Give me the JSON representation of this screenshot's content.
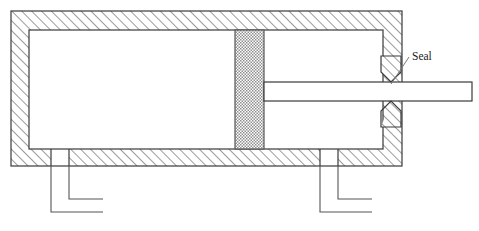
{
  "figure": {
    "kind": "engineering-cross-section",
    "title": "",
    "background_color": "#ffffff",
    "line_color": "#3a3a3a",
    "hatch_color": "#3a3a3a",
    "stipple_color": "#808080"
  },
  "labels": {
    "seal": "Seal"
  },
  "components": {
    "housing": {
      "name": "cylinder-housing",
      "wall_style": "diagonal-hatch",
      "outer": {
        "x": 11,
        "y": 11,
        "width": 391,
        "height": 155
      },
      "top_wall_thickness": 19,
      "left_wall_thickness": 18,
      "right_wall_thickness": 19,
      "bottom_wall_thickness": 17
    },
    "piston": {
      "name": "piston-block",
      "fill_style": "stipple",
      "x": 235,
      "y": 30,
      "width": 29,
      "height": 119
    },
    "rod": {
      "name": "piston-rod",
      "x": 264,
      "y": 82,
      "width": 208,
      "height": 19
    },
    "seal_upper": {
      "name": "upper-seal-wedge",
      "tip_x": 391,
      "tip_y": 82,
      "width": 20,
      "height": 26
    },
    "seal_lower": {
      "name": "lower-seal-wedge",
      "tip_x": 391,
      "tip_y": 101,
      "width": 20,
      "height": 26
    },
    "port_left": {
      "name": "left-port-pipe",
      "inner_x": 68,
      "outer_x": 51,
      "top_y": 166,
      "inner_bend_y": 199,
      "outer_bend_y": 212,
      "inner_end_x": 103,
      "outer_end_x": 103
    },
    "port_right": {
      "name": "right-port-pipe",
      "inner_x": 337,
      "outer_x": 320,
      "top_y": 166,
      "inner_bend_y": 199,
      "outer_bend_y": 212,
      "inner_end_x": 372,
      "outer_end_x": 372
    },
    "leader_line": {
      "name": "seal-leader-line",
      "from_x": 391,
      "from_y": 84,
      "to_x": 409,
      "to_y": 56
    },
    "seal_label_position": {
      "x": 412,
      "y": 60
    }
  }
}
